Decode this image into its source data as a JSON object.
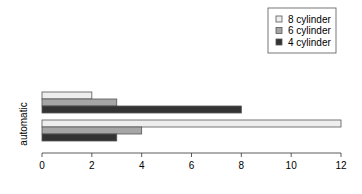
{
  "chart_data": {
    "type": "bar",
    "orientation": "horizontal",
    "grouped": true,
    "title": "",
    "xlabel": "",
    "ylabel": "automatic",
    "xlim": [
      0,
      12
    ],
    "x_ticks": [
      0,
      2,
      4,
      6,
      8,
      10,
      12
    ],
    "grid": false,
    "legend_position": "top-right",
    "groups": [
      {
        "name": "group-top",
        "values": {
          "8 cylinder": 2,
          "6 cylinder": 3,
          "4 cylinder": 8
        }
      },
      {
        "name": "group-bottom",
        "values": {
          "8 cylinder": 12,
          "6 cylinder": 4,
          "4 cylinder": 3
        }
      }
    ],
    "series": [
      {
        "name": "8 cylinder",
        "color": "#eeeeee",
        "values": [
          2,
          12
        ]
      },
      {
        "name": "6 cylinder",
        "color": "#a6a6a6",
        "values": [
          3,
          4
        ]
      },
      {
        "name": "4 cylinder",
        "color": "#333333",
        "values": [
          8,
          3
        ]
      }
    ]
  },
  "legend": {
    "items": [
      {
        "label": "8 cylinder",
        "color": "#eeeeee"
      },
      {
        "label": "6 cylinder",
        "color": "#a6a6a6"
      },
      {
        "label": "4 cylinder",
        "color": "#333333"
      }
    ]
  },
  "axis": {
    "ylabel": "automatic",
    "tick_labels": [
      "0",
      "2",
      "4",
      "6",
      "8",
      "10",
      "12"
    ]
  }
}
